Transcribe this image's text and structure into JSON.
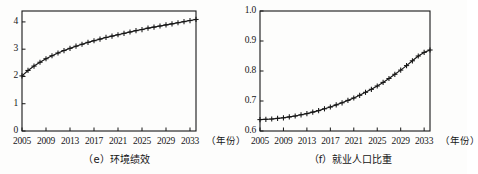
{
  "figure": {
    "background_color": "#fdfdfc",
    "ink_color": "#161616",
    "panel_count": 2
  },
  "chart_data": [
    {
      "type": "line",
      "panel_id": "e",
      "title": "（e）环境绩效",
      "caption_label": "（e）",
      "caption_text": "环境绩效",
      "xlabel": "（年份）",
      "ylabel": "",
      "xlim": [
        2005,
        2034
      ],
      "ylim": [
        0,
        4.4
      ],
      "xticks": [
        2005,
        2009,
        2013,
        2017,
        2021,
        2025,
        2029,
        2033
      ],
      "xtick_labels": [
        "2005",
        "2009",
        "2013",
        "2017",
        "2021",
        "2025",
        "2029",
        "2033"
      ],
      "yticks": [
        0,
        1,
        2,
        3,
        4
      ],
      "ytick_labels": [
        "0",
        "1",
        "2",
        "3",
        "4"
      ],
      "grid": false,
      "legend": null,
      "marker": "+",
      "line_color": "#161616",
      "x": [
        2005,
        2006,
        2007,
        2008,
        2009,
        2010,
        2011,
        2012,
        2013,
        2014,
        2015,
        2016,
        2017,
        2018,
        2019,
        2020,
        2021,
        2022,
        2023,
        2024,
        2025,
        2026,
        2027,
        2028,
        2029,
        2030,
        2031,
        2032,
        2033,
        2034
      ],
      "values": [
        2.02,
        2.22,
        2.38,
        2.52,
        2.65,
        2.76,
        2.86,
        2.95,
        3.03,
        3.11,
        3.18,
        3.25,
        3.31,
        3.37,
        3.43,
        3.48,
        3.53,
        3.58,
        3.63,
        3.68,
        3.72,
        3.77,
        3.81,
        3.85,
        3.89,
        3.93,
        3.97,
        4.01,
        4.05,
        4.09
      ]
    },
    {
      "type": "line",
      "panel_id": "f",
      "title": "（f）就业人口比重",
      "caption_label": "（f）",
      "caption_text": "就业人口比重",
      "xlabel": "（年份）",
      "ylabel": "",
      "xlim": [
        2005,
        2034
      ],
      "ylim": [
        0.6,
        1.0
      ],
      "xticks": [
        2005,
        2009,
        2013,
        2017,
        2021,
        2025,
        2029,
        2033
      ],
      "xtick_labels": [
        "2005",
        "2009",
        "2013",
        "2017",
        "2021",
        "2025",
        "2029",
        "2033"
      ],
      "yticks": [
        0.6,
        0.7,
        0.8,
        0.9,
        1.0
      ],
      "ytick_labels": [
        "0.6",
        "0.7",
        "0.8",
        "0.9",
        "1.0"
      ],
      "grid": false,
      "legend": null,
      "marker": "+",
      "line_color": "#161616",
      "x": [
        2005,
        2006,
        2007,
        2008,
        2009,
        2010,
        2011,
        2012,
        2013,
        2014,
        2015,
        2016,
        2017,
        2018,
        2019,
        2020,
        2021,
        2022,
        2023,
        2024,
        2025,
        2026,
        2027,
        2028,
        2029,
        2030,
        2031,
        2032,
        2033,
        2034
      ],
      "values": [
        0.638,
        0.639,
        0.64,
        0.642,
        0.644,
        0.647,
        0.65,
        0.654,
        0.658,
        0.663,
        0.668,
        0.674,
        0.68,
        0.687,
        0.694,
        0.702,
        0.71,
        0.719,
        0.729,
        0.739,
        0.75,
        0.762,
        0.775,
        0.789,
        0.803,
        0.818,
        0.834,
        0.85,
        0.862,
        0.87
      ]
    }
  ]
}
